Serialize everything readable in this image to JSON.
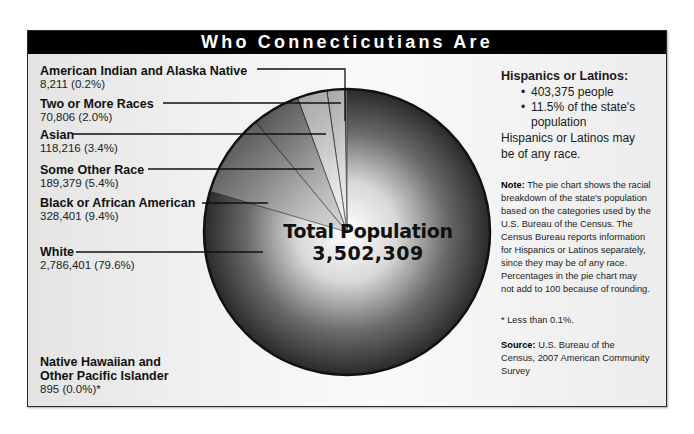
{
  "title": "Who Connecticutians Are",
  "chart_data": {
    "type": "pie",
    "title": "Who Connecticutians Are",
    "center_label": "Total Population",
    "total": 3502309,
    "total_display": "3,502,309",
    "categories": [
      "White",
      "Black or African American",
      "Some Other Race",
      "Asian",
      "Two or More Races",
      "American Indian and Alaska Native",
      "Native Hawaiian and Other Pacific Islander"
    ],
    "values": [
      2786401,
      328401,
      189379,
      118216,
      70806,
      8211,
      895
    ],
    "percentages": [
      79.6,
      9.4,
      5.4,
      3.4,
      2.0,
      0.2,
      0.0
    ],
    "footnote": "* Less than 0.1%.",
    "source": "U.S. Bureau of the Census, 2007 American Community Survey"
  },
  "labels": [
    {
      "name": "American Indian and Alaska Native",
      "value": "8,211 (0.2%)"
    },
    {
      "name": "Two or More Races",
      "value": "70,806 (2.0%)"
    },
    {
      "name": "Asian",
      "value": "118,216 (3.4%)"
    },
    {
      "name": "Some Other Race",
      "value": "189,379 (5.4%)"
    },
    {
      "name": "Black or African American",
      "value": "328,401 (9.4%)"
    },
    {
      "name": "White",
      "value": "2,786,401 (79.6%)"
    },
    {
      "name_line1": "Native Hawaiian and",
      "name_line2": "Other Pacific Islander",
      "value": "895 (0.0%)*"
    }
  ],
  "center": {
    "line1": "Total Population",
    "line2": "3,502,309"
  },
  "hispanic": {
    "title": "Hispanics or Latinos:",
    "bullets": [
      "403,375 people",
      "11.5% of the state's",
      "population"
    ],
    "note": "Hispanics or Latinos may be of any race."
  },
  "note": {
    "label": "Note:",
    "text": " The pie chart shows the racial breakdown of the state's population based on the categories used by the U.S. Bureau of the Census. The Census Bureau reports information for Hispanics or Latinos separately, since they may be of any race. Percentages in the pie chart may not add to 100 because of rounding."
  },
  "footnote": "* Less than 0.1%.",
  "source": {
    "label": "Source:",
    "text": " U.S. Bureau of the Census, 2007 American Community Survey"
  }
}
